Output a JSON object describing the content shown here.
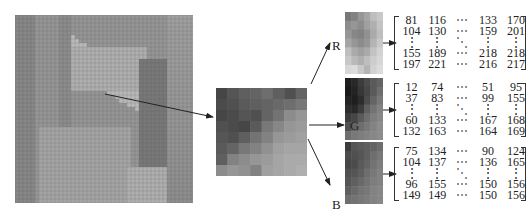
{
  "figure": {
    "source_image": {
      "icon": "gridded-photo-image"
    },
    "middle_patch": {
      "icon": "enlarged-pixel-block",
      "grid": [
        [
          70,
          85,
          95,
          100,
          110,
          95,
          80,
          100
        ],
        [
          75,
          80,
          90,
          95,
          100,
          105,
          110,
          120
        ],
        [
          70,
          75,
          85,
          80,
          100,
          115,
          140,
          150
        ],
        [
          80,
          75,
          70,
          90,
          120,
          135,
          150,
          155
        ],
        [
          85,
          80,
          95,
          115,
          130,
          150,
          155,
          160
        ],
        [
          90,
          100,
          120,
          130,
          145,
          160,
          165,
          165
        ],
        [
          95,
          130,
          140,
          150,
          155,
          165,
          170,
          170
        ],
        [
          140,
          150,
          145,
          130,
          160,
          165,
          170,
          175
        ]
      ]
    },
    "channels": [
      {
        "label": "R",
        "grid": [
          [
            120,
            130,
            150,
            165,
            190,
            200
          ],
          [
            140,
            150,
            140,
            160,
            175,
            195
          ],
          [
            150,
            135,
            130,
            145,
            170,
            190
          ],
          [
            165,
            150,
            140,
            150,
            180,
            200
          ],
          [
            190,
            170,
            160,
            170,
            195,
            210
          ],
          [
            200,
            185,
            175,
            190,
            205,
            215
          ],
          [
            215,
            220,
            200,
            180,
            210,
            220
          ]
        ],
        "matrix": [
          [
            "81",
            "116",
            "⋯",
            "133",
            "170"
          ],
          [
            "104",
            "130",
            "⋯",
            "159",
            "201"
          ],
          [
            "⋮",
            "⋮",
            "⋱",
            "⋮",
            "⋮"
          ],
          [
            "155",
            "189",
            "⋯",
            "218",
            "218"
          ],
          [
            "197",
            "221",
            "⋯",
            "216",
            "217"
          ]
        ]
      },
      {
        "label": "G",
        "grid": [
          [
            30,
            40,
            60,
            75,
            90,
            100
          ],
          [
            25,
            35,
            55,
            70,
            90,
            110
          ],
          [
            35,
            30,
            45,
            75,
            100,
            120
          ],
          [
            45,
            40,
            60,
            95,
            115,
            130
          ],
          [
            60,
            70,
            90,
            110,
            125,
            135
          ],
          [
            80,
            100,
            110,
            120,
            130,
            140
          ],
          [
            110,
            120,
            125,
            130,
            135,
            140
          ]
        ],
        "matrix": [
          [
            "12",
            "74",
            "⋯",
            "51",
            "95"
          ],
          [
            "37",
            "83",
            "⋯",
            "99",
            "155"
          ],
          [
            "⋮",
            "⋮",
            "⋱",
            "⋮",
            "⋮"
          ],
          [
            "60",
            "133",
            "⋯",
            "167",
            "168"
          ],
          [
            "132",
            "163",
            "⋯",
            "164",
            "169"
          ]
        ]
      },
      {
        "label": "B",
        "grid": [
          [
            60,
            85,
            90,
            95,
            100,
            110
          ],
          [
            75,
            80,
            85,
            95,
            110,
            120
          ],
          [
            70,
            75,
            90,
            100,
            115,
            125
          ],
          [
            80,
            85,
            95,
            110,
            120,
            130
          ],
          [
            85,
            95,
            105,
            115,
            125,
            130
          ],
          [
            95,
            105,
            115,
            120,
            130,
            135
          ],
          [
            110,
            115,
            120,
            125,
            130,
            135
          ]
        ],
        "matrix": [
          [
            "75",
            "134",
            "⋯",
            "90",
            "124"
          ],
          [
            "104",
            "137",
            "⋯",
            "136",
            "165"
          ],
          [
            "⋮",
            "⋮",
            "⋱",
            "⋮",
            "⋮"
          ],
          [
            "96",
            "155",
            "⋯",
            "150",
            "156"
          ],
          [
            "149",
            "149",
            "⋯",
            "150",
            "156"
          ]
        ]
      }
    ]
  }
}
